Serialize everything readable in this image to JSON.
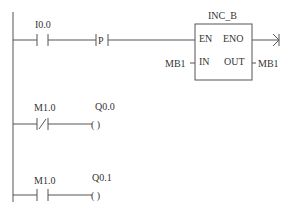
{
  "rungs": [
    {
      "contact": {
        "address": "I0.0",
        "type": "normally-open"
      },
      "edge": {
        "label": "P",
        "type": "positive-transition"
      },
      "block": {
        "name": "INC_B",
        "pins": {
          "en": "EN",
          "eno": "ENO",
          "in": "IN",
          "out": "OUT"
        },
        "in_operand": "MB1",
        "out_operand": "MB1"
      }
    },
    {
      "contact": {
        "address": "M1.0",
        "type": "normally-closed"
      },
      "coil": {
        "address": "Q0.0",
        "symbol": "(  )"
      }
    },
    {
      "contact": {
        "address": "M1.0",
        "type": "normally-open"
      },
      "coil": {
        "address": "Q0.1",
        "symbol": "(  )"
      }
    }
  ]
}
